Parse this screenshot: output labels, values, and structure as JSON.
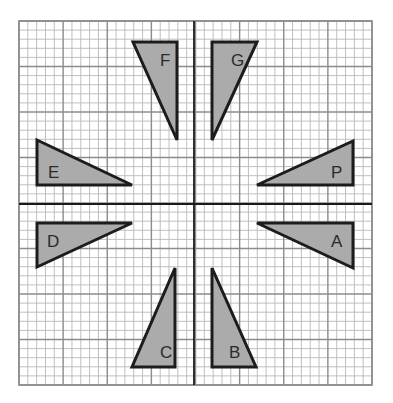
{
  "diagram": {
    "type": "grid-with-axes",
    "grid": {
      "x0": 19,
      "y0": 21,
      "x1": 372,
      "y1": 385,
      "cols": 40,
      "rows": 40,
      "major_every": 5,
      "minor_color": "#b8b8b8",
      "major_color": "#8c8c8c"
    },
    "axes": {
      "x_axis_y": 204,
      "y_axis_x": 194,
      "color": "#1a1a1a"
    },
    "style": {
      "shape_fill": "#ababab",
      "shape_stroke": "#1c1c1c",
      "label_color": "#2a2a2a"
    },
    "shapes": [
      {
        "label": "F",
        "points": [
          [
            133,
            42
          ],
          [
            177,
            42
          ],
          [
            177,
            140
          ]
        ],
        "label_pos": [
          160,
          66
        ]
      },
      {
        "label": "G",
        "points": [
          [
            212,
            42
          ],
          [
            257,
            42
          ],
          [
            212,
            140
          ]
        ],
        "label_pos": [
          231,
          66
        ]
      },
      {
        "label": "E",
        "points": [
          [
            37,
            140
          ],
          [
            37,
            185
          ],
          [
            132,
            185
          ]
        ],
        "label_pos": [
          48,
          178
        ]
      },
      {
        "label": "P",
        "points": [
          [
            257,
            185
          ],
          [
            353,
            141
          ],
          [
            353,
            185
          ]
        ],
        "label_pos": [
          331,
          178
        ]
      },
      {
        "label": "D",
        "points": [
          [
            37,
            223
          ],
          [
            132,
            223
          ],
          [
            37,
            267
          ]
        ],
        "label_pos": [
          47,
          247
        ]
      },
      {
        "label": "A",
        "points": [
          [
            257,
            223
          ],
          [
            353,
            223
          ],
          [
            353,
            268
          ]
        ],
        "label_pos": [
          331,
          247
        ]
      },
      {
        "label": "C",
        "points": [
          [
            175,
            268
          ],
          [
            175,
            367
          ],
          [
            132,
            367
          ]
        ],
        "label_pos": [
          160,
          358
        ]
      },
      {
        "label": "B",
        "points": [
          [
            212,
            268
          ],
          [
            212,
            367
          ],
          [
            256,
            367
          ]
        ],
        "label_pos": [
          229,
          358
        ]
      }
    ]
  }
}
